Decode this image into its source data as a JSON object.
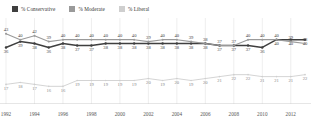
{
  "legend": {
    "position": "top-left",
    "items": [
      {
        "label": "% Conservative",
        "color": "#3f3f3f",
        "icon": "square-swatch-icon"
      },
      {
        "label": "% Moderate",
        "color": "#9a9a9a",
        "icon": "square-swatch-icon"
      },
      {
        "label": "% Liberal",
        "color": "#cfcfcf",
        "icon": "square-swatch-icon"
      }
    ]
  },
  "chart_data": {
    "type": "line",
    "title": "",
    "subtitle": "",
    "xlabel": "",
    "ylabel": "",
    "grid": "vertical",
    "ylim": [
      10,
      46
    ],
    "xlim": [
      1992,
      2013
    ],
    "x": [
      1992,
      1993,
      1994,
      1995,
      1996,
      1997,
      1998,
      1999,
      2000,
      2001,
      2002,
      2003,
      2004,
      2005,
      2006,
      2007,
      2008,
      2009,
      2010,
      2011,
      2012,
      2013
    ],
    "tick_labels": [
      "1992",
      "1994",
      "1996",
      "1998",
      "2000",
      "2002",
      "2004",
      "2006",
      "2008",
      "2010",
      "2012"
    ],
    "tick_values": [
      1992,
      1994,
      1996,
      1998,
      2000,
      2002,
      2004,
      2006,
      2008,
      2010,
      2012
    ],
    "series": [
      {
        "name": "% Conservative",
        "color": "#3f3f3f",
        "label_position": "below",
        "values": [
          36,
          39,
          38,
          36,
          38,
          37,
          37,
          38,
          38,
          38,
          38,
          38,
          38,
          38,
          38,
          37,
          37,
          37,
          36,
          40,
          40,
          40
        ]
      },
      {
        "name": "% Moderate",
        "color": "#9a9a9a",
        "label_position": "above",
        "values": [
          43,
          40,
          42,
          39,
          40,
          40,
          40,
          40,
          40,
          40,
          39,
          40,
          40,
          39,
          38,
          37,
          37,
          40,
          40,
          40,
          39,
          38
        ]
      },
      {
        "name": "% Liberal",
        "color": "#cfcfcf",
        "label_position": "below",
        "values": [
          17,
          18,
          17,
          16,
          16,
          19,
          19,
          19,
          19,
          19,
          20,
          19,
          20,
          19,
          20,
          21,
          22,
          22,
          21,
          21,
          21,
          22
        ]
      }
    ],
    "tail_labels": {
      "conservative_last": "38",
      "moderate_last": "34",
      "liberal_last": "23"
    },
    "note": "Annual data points 1992-2013; axis labelled every two years."
  }
}
